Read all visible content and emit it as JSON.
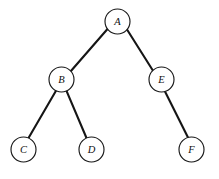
{
  "figure": {
    "type": "tree-diagram",
    "width": 219,
    "height": 179,
    "background_color": "#ffffff",
    "node_fill_color": "#ffffff",
    "node_stroke_color": "#171717",
    "edge_color": "#151515",
    "label_color": "#101010",
    "node_radius": 12.5
  },
  "tree": {
    "root": "A",
    "nodes": [
      {
        "id": "A",
        "label": "A",
        "cx": 117.5,
        "cy": 21.5,
        "r": 12.5,
        "depth": 0
      },
      {
        "id": "B",
        "label": "B",
        "cx": 61.5,
        "cy": 79.5,
        "r": 12.5,
        "depth": 1
      },
      {
        "id": "E",
        "label": "E",
        "cx": 161.5,
        "cy": 79.5,
        "r": 12.5,
        "depth": 1
      },
      {
        "id": "C",
        "label": "C",
        "cx": 23.5,
        "cy": 149.5,
        "r": 12.5,
        "depth": 2
      },
      {
        "id": "D",
        "label": "D",
        "cx": 91.5,
        "cy": 149.5,
        "r": 12.5,
        "depth": 2
      },
      {
        "id": "F",
        "label": "F",
        "cx": 191.5,
        "cy": 149.5,
        "r": 12.5,
        "depth": 2
      }
    ],
    "edges": [
      {
        "id": "A-B",
        "from": "A",
        "to": "B",
        "side": "left",
        "x1": 107.5,
        "y1": 29.0,
        "x2": 70.5,
        "y2": 71.5
      },
      {
        "id": "A-E",
        "from": "A",
        "to": "E",
        "side": "right",
        "x1": 127.0,
        "y1": 29.5,
        "x2": 153.5,
        "y2": 71.5
      },
      {
        "id": "B-C",
        "from": "B",
        "to": "C",
        "side": "left",
        "x1": 56.0,
        "y1": 90.8,
        "x2": 28.5,
        "y2": 138.0
      },
      {
        "id": "B-D",
        "from": "B",
        "to": "D",
        "side": "right",
        "x1": 66.5,
        "y1": 90.9,
        "x2": 86.5,
        "y2": 138.0
      },
      {
        "id": "E-F",
        "from": "E",
        "to": "F",
        "side": "right",
        "x1": 165.0,
        "y1": 91.5,
        "x2": 188.0,
        "y2": 137.5
      }
    ]
  }
}
